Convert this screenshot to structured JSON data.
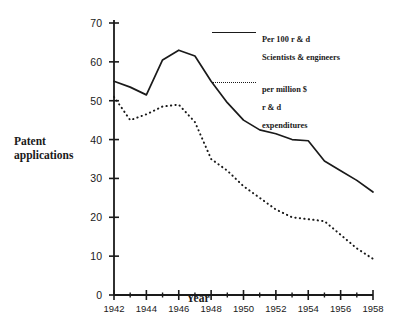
{
  "chart_data": {
    "type": "line",
    "title": "",
    "xlabel": "Year",
    "ylabel": "Patent\napplications",
    "ylabel_lines": [
      "Patent",
      "applications"
    ],
    "xlim": [
      1942,
      1958
    ],
    "ylim": [
      0,
      70
    ],
    "grid": false,
    "legend_position": "upper-right-inside",
    "y_ticks": [
      0,
      10,
      20,
      30,
      40,
      50,
      60,
      70
    ],
    "y_tick_labels": [
      "0",
      "10",
      "20",
      "30",
      "40",
      "50",
      "60",
      "70"
    ],
    "x_ticks": [
      1942,
      1944,
      1946,
      1948,
      1950,
      1952,
      1954,
      1956,
      1958
    ],
    "x_tick_labels": [
      "1942",
      "1944",
      "1946",
      "1948",
      "1950",
      "1952",
      "1954",
      "1956",
      "1958"
    ],
    "x_minor_ticks": [
      1943,
      1945,
      1947,
      1949,
      1951,
      1953,
      1955,
      1957
    ],
    "x": [
      1942,
      1943,
      1944,
      1945,
      1946,
      1947,
      1948,
      1949,
      1950,
      1951,
      1952,
      1953,
      1954,
      1955,
      1956,
      1957,
      1958
    ],
    "series": [
      {
        "name": "Per 100 r & d\nScientists & engineers",
        "name_lines": [
          "Per 100 r & d",
          "Scientists & engineers"
        ],
        "style": "solid",
        "color": "#1a1a1a",
        "values": [
          55.0,
          53.5,
          51.5,
          60.5,
          63.0,
          61.5,
          55.0,
          49.5,
          45.0,
          42.5,
          41.5,
          40.0,
          39.7,
          34.5,
          32.0,
          29.5,
          26.5
        ]
      },
      {
        "name": "per million $\nr & d\nexpenditures",
        "name_lines": [
          "per million $",
          "r & d",
          "expenditures"
        ],
        "style": "dotted",
        "color": "#1a1a1a",
        "values": [
          51.0,
          45.0,
          46.5,
          48.5,
          49.0,
          44.5,
          35.0,
          32.0,
          28.0,
          25.0,
          22.0,
          20.0,
          19.5,
          19.0,
          15.5,
          12.0,
          9.3
        ]
      }
    ]
  },
  "axis_title": {
    "y": "Patent\napplications",
    "x": "Year"
  },
  "legend": {
    "solid_label": "Per 100 r & d\nScientists & engineers",
    "dotted_label": "per million $\nr & d\nexpenditures"
  },
  "colors": {
    "ink": "#1a1a1a",
    "background": "#ffffff"
  }
}
